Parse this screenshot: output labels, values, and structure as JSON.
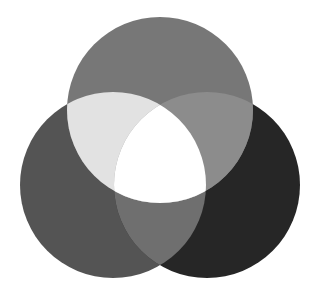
{
  "diagram": {
    "type": "venn-3",
    "canvas": {
      "width": 321,
      "height": 290,
      "background": "#ffffff"
    },
    "circles": [
      {
        "id": "top",
        "cx": 160,
        "cy": 110,
        "r": 93,
        "fill": "#777777"
      },
      {
        "id": "left",
        "cx": 113,
        "cy": 185,
        "r": 93,
        "fill": "#545454"
      },
      {
        "id": "right",
        "cx": 207,
        "cy": 185,
        "r": 93,
        "fill": "#262626"
      }
    ],
    "overlaps": {
      "top_left": "#e2e2e2",
      "top_right": "#8c8c8c",
      "left_right": "#6f6f6f",
      "all_three": "#ffffff"
    }
  }
}
